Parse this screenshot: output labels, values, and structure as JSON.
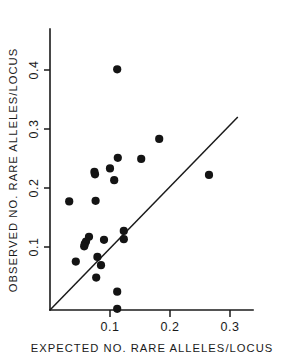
{
  "chart_data": {
    "type": "scatter",
    "title": "",
    "xlabel": "EXPECTED NO. RARE ALLELES/LOCUS",
    "ylabel": "OBSERVED NO. RARE ALLELES/LOCUS",
    "xlim": [
      0.0,
      0.335
    ],
    "ylim": [
      0.0,
      0.435
    ],
    "xticks": [
      0.1,
      0.2,
      0.3
    ],
    "xticklabels": [
      "0.1",
      "0.2",
      "0.3"
    ],
    "yticks": [
      0.1,
      0.2,
      0.3,
      0.4
    ],
    "yticklabels": [
      "0.1",
      "0.2",
      "0.3",
      "0.4"
    ],
    "grid": false,
    "legend": null,
    "marker": "filled-circle",
    "marker_color": "#141414",
    "annotations": [
      {
        "name": "identity-reference-line",
        "type": "line",
        "description": "1:1 diagonal reference line from origin",
        "x": [
          0.0,
          0.313
        ],
        "y": [
          0.0,
          0.327
        ]
      }
    ],
    "points": [
      {
        "x": 0.112,
        "y": 0.408
      },
      {
        "x": 0.182,
        "y": 0.29
      },
      {
        "x": 0.113,
        "y": 0.258
      },
      {
        "x": 0.152,
        "y": 0.256
      },
      {
        "x": 0.1,
        "y": 0.24
      },
      {
        "x": 0.074,
        "y": 0.234
      },
      {
        "x": 0.075,
        "y": 0.23
      },
      {
        "x": 0.265,
        "y": 0.229
      },
      {
        "x": 0.107,
        "y": 0.22
      },
      {
        "x": 0.076,
        "y": 0.185
      },
      {
        "x": 0.032,
        "y": 0.184
      },
      {
        "x": 0.123,
        "y": 0.134
      },
      {
        "x": 0.09,
        "y": 0.119
      },
      {
        "x": 0.123,
        "y": 0.12
      },
      {
        "x": 0.065,
        "y": 0.124
      },
      {
        "x": 0.06,
        "y": 0.116
      },
      {
        "x": 0.058,
        "y": 0.112
      },
      {
        "x": 0.057,
        "y": 0.108
      },
      {
        "x": 0.079,
        "y": 0.09
      },
      {
        "x": 0.043,
        "y": 0.082
      },
      {
        "x": 0.085,
        "y": 0.076
      },
      {
        "x": 0.077,
        "y": 0.055
      },
      {
        "x": 0.112,
        "y": 0.031
      },
      {
        "x": 0.112,
        "y": 0.002
      }
    ]
  },
  "axes": {
    "x_tick_label_0": "0.1",
    "x_tick_label_1": "0.2",
    "x_tick_label_2": "0.3",
    "y_tick_label_0": "0.1",
    "y_tick_label_1": "0.2",
    "y_tick_label_2": "0.3",
    "y_tick_label_3": "0.4",
    "x_axis_title": "EXPECTED NO. RARE ALLELES/LOCUS",
    "y_axis_title": "OBSERVED NO. RARE ALLELES/LOCUS"
  }
}
